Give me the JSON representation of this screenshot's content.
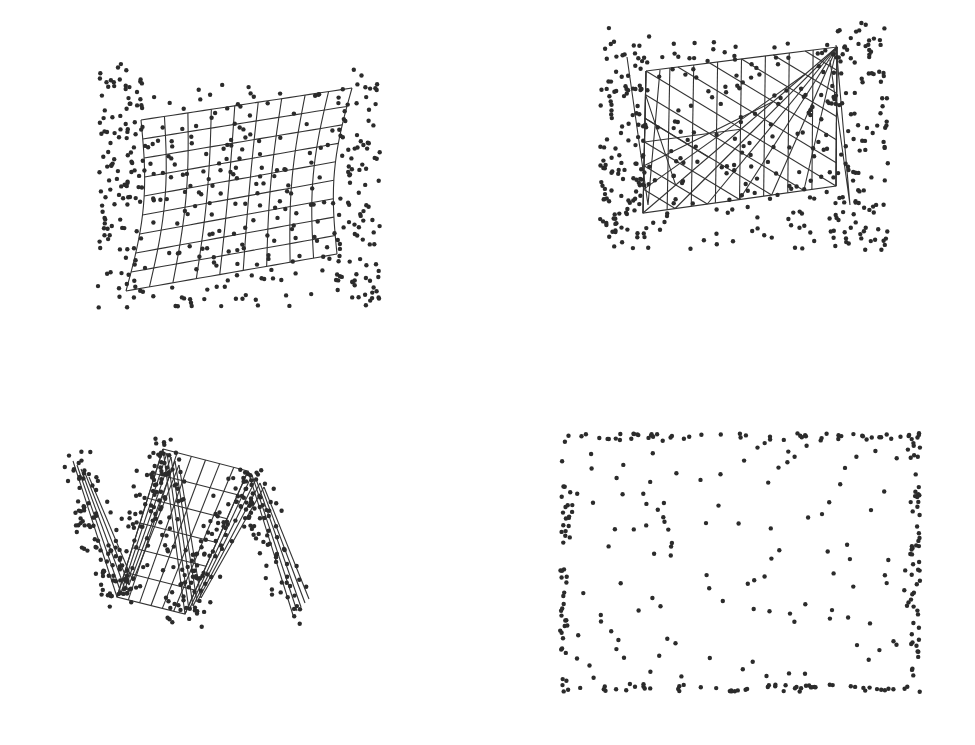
{
  "figure": {
    "panels": [
      {
        "id": "top-left",
        "description": "warped grid mesh with scattered points",
        "corners": {
          "tl": [
            141,
            120
          ],
          "tr": [
            352,
            88
          ],
          "br": [
            337,
            254
          ],
          "bl": [
            126,
            291
          ]
        },
        "grid": {
          "cols": 9,
          "rows": 9,
          "bow": 10
        },
        "dots": {
          "count": 420,
          "spread": 28,
          "seed": 11,
          "bbox": [
            98,
            64,
            382,
            308
          ]
        }
      },
      {
        "id": "top-right",
        "description": "rectangular mesh with diagonal cross-hatching and scattered points",
        "corners": {
          "tl": [
            646,
            71
          ],
          "tr": [
            837,
            47
          ],
          "br": [
            836,
            186
          ],
          "bl": [
            643,
            213
          ]
        },
        "grid": {
          "cols": 8,
          "diagonals": 6
        },
        "dots": {
          "count": 430,
          "spread": 24,
          "seed": 23,
          "bbox": [
            600,
            22,
            888,
            250
          ]
        }
      },
      {
        "id": "bottom-left",
        "description": "folded zigzag mesh with scattered points",
        "path": [
          [
            73,
            461
          ],
          [
            117,
            597
          ],
          [
            163,
            449
          ],
          [
            185,
            614
          ],
          [
            248,
            471
          ],
          [
            293,
            615
          ]
        ],
        "dots": {
          "count": 380,
          "spread": 18,
          "seed": 37,
          "bbox": [
            58,
            428,
            308,
            660
          ]
        }
      },
      {
        "id": "bottom-right",
        "description": "scattered points concentrated along rectangle edges, no mesh",
        "rect": [
          560,
          433,
          920,
          692
        ],
        "dots": {
          "count": 330,
          "edge_fraction": 0.6,
          "seed": 53
        }
      }
    ],
    "colors": {
      "background": "#ffffff",
      "ink": "#2b2b2b",
      "mesh": "#333333"
    }
  }
}
